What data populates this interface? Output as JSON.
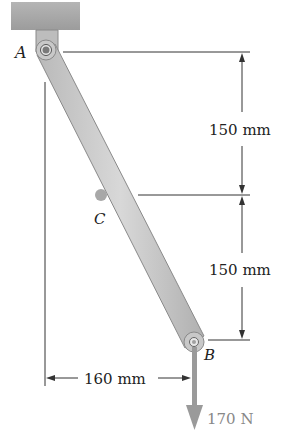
{
  "diagram": {
    "points": {
      "A": {
        "label": "A"
      },
      "B": {
        "label": "B"
      },
      "C": {
        "label": "C"
      }
    },
    "dimensions": {
      "upper_vertical": "150 mm",
      "lower_vertical": "150 mm",
      "horizontal": "160 mm"
    },
    "load": {
      "label": "170 N"
    },
    "colors": {
      "ceiling": "#a9a9a9",
      "bar": "#c8c8c8",
      "bar_edge": "#8a8a8a",
      "line": "#333333",
      "force": "#9a9a9a",
      "point_c": "#a8a8a8"
    }
  }
}
